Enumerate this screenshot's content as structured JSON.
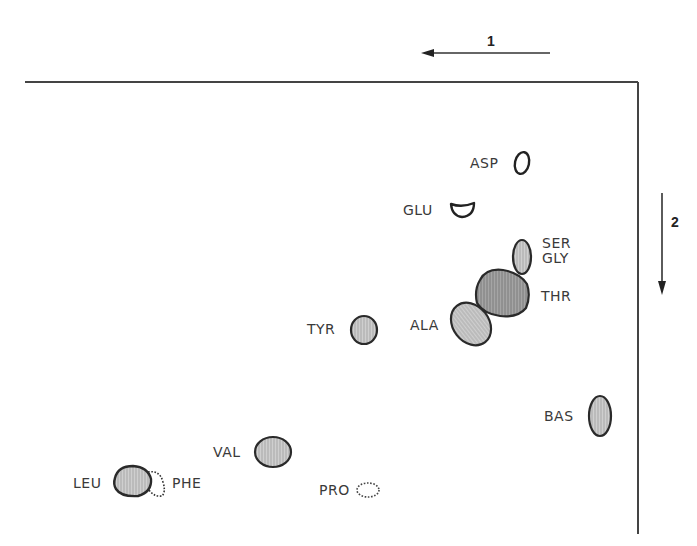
{
  "diagram": {
    "frame": {
      "top_y": 82,
      "left_x": 25,
      "right_x": 638,
      "bottom_y": 534,
      "stroke": "#444444"
    },
    "direction_1": {
      "label": "1",
      "x1": 550,
      "y1": 53,
      "x2": 422,
      "y2": 53,
      "label_x": 487,
      "label_y": 33
    },
    "direction_2": {
      "label": "2",
      "x1": 662,
      "y1": 193,
      "x2": 662,
      "y2": 294,
      "label_x": 670,
      "label_y": 213
    },
    "colors": {
      "spot_fill": "#c4c4c4",
      "spot_fill_dark": "#9c9c9c",
      "outline": "#2a2a2a",
      "text": "#3a3a3a"
    },
    "spots": [
      {
        "id": "asp",
        "label": "ASP",
        "label_x": 470,
        "label_y": 157,
        "shape": "ellipse",
        "cx": 522,
        "cy": 163,
        "rx": 7,
        "ry": 11,
        "rot": 12,
        "fill": "none",
        "dashed": false
      },
      {
        "id": "glu",
        "label": "GLU",
        "label_x": 403,
        "label_y": 204,
        "shape": "cup",
        "cx": 462,
        "cy": 210,
        "fill": "none",
        "dashed": false
      },
      {
        "id": "ser-gly",
        "label": "SER\nGLY",
        "label_x": 542,
        "label_y": 237,
        "shape": "ellipse",
        "cx": 522,
        "cy": 257,
        "rx": 9,
        "ry": 17,
        "rot": 0,
        "fill": "#c4c4c4",
        "dashed": false
      },
      {
        "id": "thr",
        "label": "THR",
        "label_x": 541,
        "label_y": 290,
        "shape": "blob",
        "cx": 502,
        "cy": 293,
        "fill": "#9c9c9c",
        "dashed": false
      },
      {
        "id": "ala",
        "label": "ALA",
        "label_x": 410,
        "label_y": 318,
        "shape": "ellipse",
        "cx": 471,
        "cy": 324,
        "rx": 19,
        "ry": 22,
        "rot": -35,
        "fill": "#c4c4c4",
        "dashed": false
      },
      {
        "id": "tyr",
        "label": "TYR",
        "label_x": 307,
        "label_y": 323,
        "shape": "ellipse",
        "cx": 364,
        "cy": 330,
        "rx": 13,
        "ry": 14,
        "rot": 0,
        "fill": "#c4c4c4",
        "dashed": false
      },
      {
        "id": "bas",
        "label": "BAS",
        "label_x": 544,
        "label_y": 410,
        "shape": "ellipse",
        "cx": 600,
        "cy": 416,
        "rx": 11,
        "ry": 20,
        "rot": 0,
        "fill": "#c4c4c4",
        "dashed": false
      },
      {
        "id": "val",
        "label": "VAL",
        "label_x": 213,
        "label_y": 445,
        "shape": "ellipse",
        "cx": 273,
        "cy": 452,
        "rx": 18,
        "ry": 15,
        "rot": 0,
        "fill": "#c4c4c4",
        "dashed": false
      },
      {
        "id": "leu",
        "label": "LEU",
        "label_x": 73,
        "label_y": 477,
        "shape": "ellipse",
        "cx": 132,
        "cy": 481,
        "rx": 19,
        "ry": 15,
        "rot": 5,
        "fill": "#c4c4c4",
        "dashed": false
      },
      {
        "id": "phe",
        "label": "PHE",
        "label_x": 172,
        "label_y": 477,
        "shape": "dotted-blob",
        "cx": 158,
        "cy": 486,
        "fill": "none",
        "dashed": true
      },
      {
        "id": "pro",
        "label": "PRO",
        "label_x": 319,
        "label_y": 484,
        "shape": "ellipse",
        "cx": 368,
        "cy": 490,
        "rx": 11,
        "ry": 7,
        "rot": 0,
        "fill": "none",
        "dashed": true
      }
    ]
  }
}
